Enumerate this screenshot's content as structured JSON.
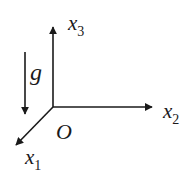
{
  "diagram": {
    "colors": {
      "stroke": "#1a1a1a",
      "background": "#ffffff"
    },
    "origin": {
      "label": "O"
    },
    "axes": [
      {
        "name": "x1",
        "base": "x",
        "subscript": "1",
        "direction": "out-of-page (down-left)"
      },
      {
        "name": "x2",
        "base": "x",
        "subscript": "2",
        "direction": "right"
      },
      {
        "name": "x3",
        "base": "x",
        "subscript": "3",
        "direction": "up"
      }
    ],
    "gravity": {
      "label": "g",
      "direction": "down"
    }
  }
}
